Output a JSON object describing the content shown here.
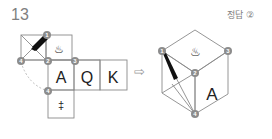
{
  "question": {
    "number": "13"
  },
  "answer": {
    "label": "정답",
    "value": "②"
  },
  "net": {
    "cells": [
      {
        "id": "cross-cell",
        "label": ""
      },
      {
        "id": "steam-cell",
        "label": "♨"
      },
      {
        "id": "a-cell",
        "label": "A"
      },
      {
        "id": "q-cell",
        "label": "Q"
      },
      {
        "id": "k-cell",
        "label": "K"
      },
      {
        "id": "dagger-cell",
        "label": "‡"
      }
    ],
    "markers": [
      "1",
      "2",
      "3",
      "4",
      "4"
    ]
  },
  "arrow": {
    "symbol": "⇨"
  },
  "cube": {
    "top_label": "♨",
    "right_label": "A",
    "markers": [
      "1",
      "2",
      "3",
      "4"
    ]
  },
  "colors": {
    "line": "#8a8a8a",
    "marker": "#8c8c8c",
    "stripe": "#111111",
    "text": "#222222"
  }
}
